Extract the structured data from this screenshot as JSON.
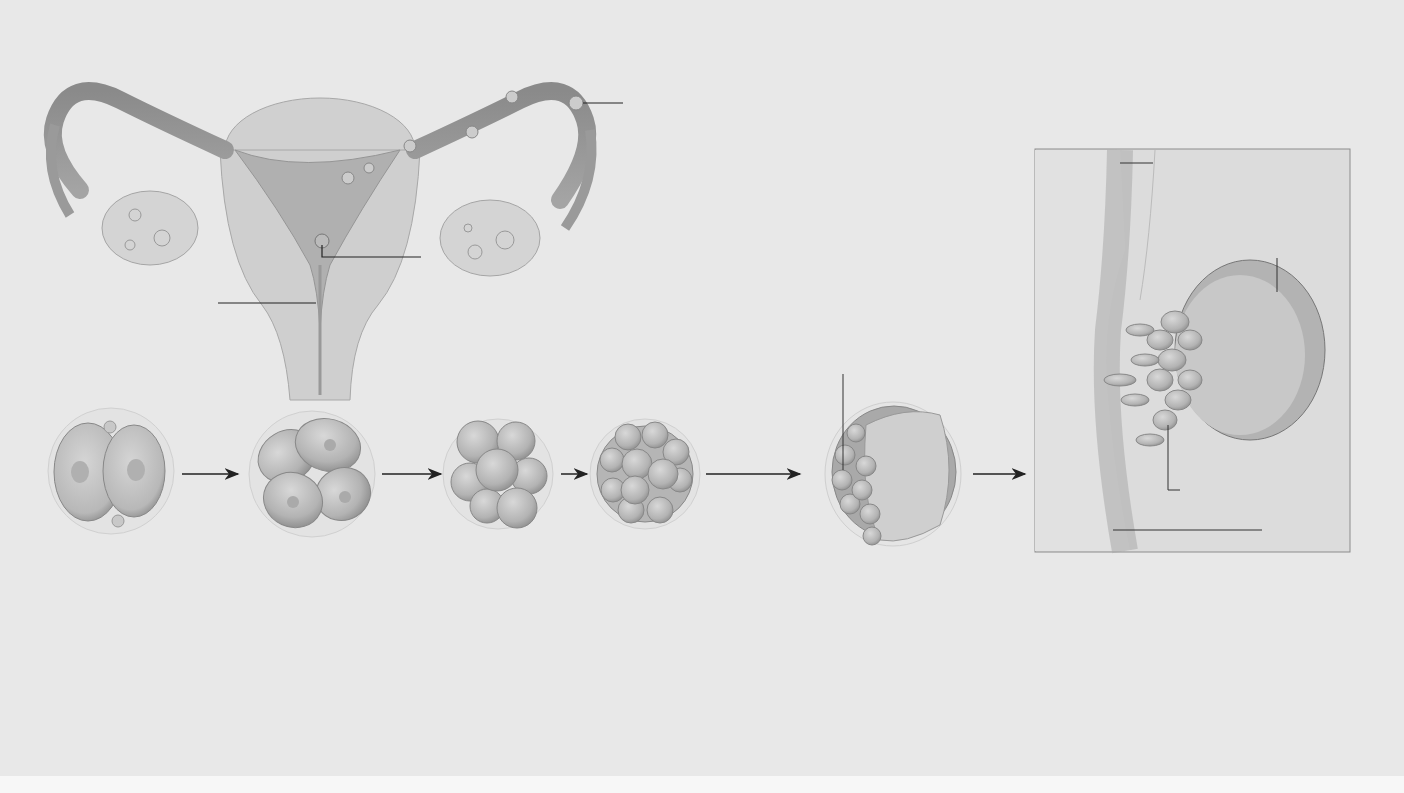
{
  "figure": {
    "uterus_labels": {
      "fertilization": "fertilization",
      "implantation": "implantation",
      "endometrium": "endometrium"
    },
    "stage_labels": {
      "inner_cell_mass_day5": "inner cell mass",
      "fluid": "fluid"
    },
    "inset_labels": {
      "endometrium": "endometrium",
      "trophoblast_line1": "trophoblast (surface",
      "trophoblast_line2": "layer of cells of the",
      "trophoblast_line3": "blastocyst)",
      "blastocoel": "blastocoel",
      "inner_cell_mass": "inner cell mass",
      "uterine_line1": "uterine",
      "uterine_line2": "cavity"
    },
    "scale": {
      "line1": "actual",
      "line2": "size"
    }
  },
  "captions": [
    {
      "letter": "A",
      "title": "Days 1–2.",
      "lines": [
        "The first cleavage",
        "furrow extends",
        "between the two",
        "polar bodies."
      ]
    },
    {
      "letter": "B",
      "title": "Day 3.",
      "lines": [
        "After the third",
        "cleavage, cells",
        "form a compact",
        "ball."
      ]
    },
    {
      "letter": "C",
      "title": "Day 4.",
      "lines": [
        "By 96 hours  there is a ball",
        "of 16 to 32 cells. This is the",
        "morula. Cells of the surface",
        "layer will function in",
        "implantation and will give",
        "rise to a membrane, the",
        "chorion."
      ]
    },
    {
      "letter": "D",
      "title": "Day 5.",
      "lines": [
        "A fluid-filled cavity forms in",
        "the morula. By the 32-cell",
        "stage, differentiation is",
        "occurring in an inner cell",
        "mass that will give rise to",
        "the embryo. This embryonic",
        "stage is the blastocyst."
      ]
    },
    {
      "letter": "E",
      "title": "Days 6–7.",
      "lines": [
        "Some of the blastocyst’s",
        "surface cells attach",
        "themselves to the",
        "endometrium and start to",
        "burrow into it. Implantation",
        "has started."
      ]
    }
  ]
}
